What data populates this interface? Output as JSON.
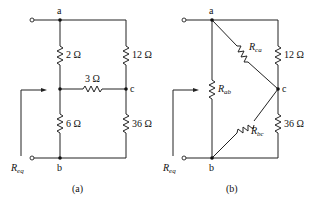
{
  "figure": {
    "panel_a": {
      "caption": "(a)",
      "nodes": {
        "a": "a",
        "b": "b",
        "c": "c"
      },
      "resistors": {
        "r_top_left": "2 Ω",
        "r_top_right": "12 Ω",
        "r_middle": "3 Ω",
        "r_bottom_left": "6 Ω",
        "r_bottom_right": "36 Ω"
      },
      "req_label": {
        "main": "R",
        "sub": "eq"
      }
    },
    "panel_b": {
      "caption": "(b)",
      "nodes": {
        "a": "a",
        "b": "b",
        "c": "c"
      },
      "resistors": {
        "r_ab": {
          "main": "R",
          "sub": "ab"
        },
        "r_ca": {
          "main": "R",
          "sub": "ca"
        },
        "r_bc": {
          "main": "R",
          "sub": "bc"
        },
        "r_top_right": "12 Ω",
        "r_bottom_right": "36 Ω"
      },
      "req_label": {
        "main": "R",
        "sub": "eq"
      }
    }
  }
}
